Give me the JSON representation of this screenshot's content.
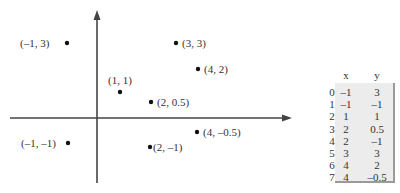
{
  "points": [
    {
      "x": -1,
      "y": 3,
      "label": "(–1, 3)",
      "px": 67,
      "py": 43,
      "lx": 20,
      "ly": 47,
      "anchor": "start"
    },
    {
      "x": 3,
      "y": 3,
      "label": "(3, 3)",
      "px": 176,
      "py": 43,
      "lx": 182,
      "ly": 47,
      "anchor": "start"
    },
    {
      "x": 4,
      "y": 2,
      "label": "(4, 2)",
      "px": 198,
      "py": 69,
      "lx": 204,
      "ly": 73,
      "anchor": "start"
    },
    {
      "x": 1,
      "y": 1,
      "label": "(1, 1)",
      "px": 120,
      "py": 92,
      "lx": 108,
      "ly": 84,
      "anchor": "start"
    },
    {
      "x": 2,
      "y": 0.5,
      "label": "(2, 0.5)",
      "px": 151,
      "py": 102,
      "lx": 157,
      "ly": 106,
      "anchor": "start"
    },
    {
      "x": -1,
      "y": -1,
      "label": "(–1, –1)",
      "px": 68,
      "py": 143,
      "lx": 21,
      "ly": 147,
      "anchor": "start"
    },
    {
      "x": 2,
      "y": -1,
      "label": "(2, –1)",
      "px": 150,
      "py": 147,
      "lx": 153,
      "ly": 151,
      "anchor": "start"
    },
    {
      "x": 4,
      "y": -0.5,
      "label": "(4, –0.5)",
      "px": 197,
      "py": 132,
      "lx": 203,
      "ly": 136,
      "anchor": "start"
    }
  ],
  "table": {
    "headers": [
      "x",
      "y"
    ],
    "rows": [
      {
        "idx": "0",
        "x": "–1",
        "y": "3"
      },
      {
        "idx": "1",
        "x": "–1",
        "y": "–1"
      },
      {
        "idx": "2",
        "x": "1",
        "y": "1"
      },
      {
        "idx": "3",
        "x": "2",
        "y": "0.5"
      },
      {
        "idx": "4",
        "x": "2",
        "y": "–1"
      },
      {
        "idx": "5",
        "x": "3",
        "y": "3"
      },
      {
        "idx": "6",
        "x": "4",
        "y": "2"
      },
      {
        "idx": "7",
        "x": "4",
        "y": "–0.5"
      }
    ]
  },
  "chart_data": {
    "type": "scatter",
    "title": "",
    "xlabel": "x",
    "ylabel": "y",
    "x": [
      -1,
      -1,
      1,
      2,
      2,
      3,
      4,
      4
    ],
    "y": [
      3,
      -1,
      1,
      0.5,
      -1,
      3,
      2,
      -0.5
    ],
    "annotations": [
      "(–1, 3)",
      "(–1, –1)",
      "(1, 1)",
      "(2, 0.5)",
      "(2, –1)",
      "(3, 3)",
      "(4, 2)",
      "(4, –0.5)"
    ],
    "grid": false
  }
}
